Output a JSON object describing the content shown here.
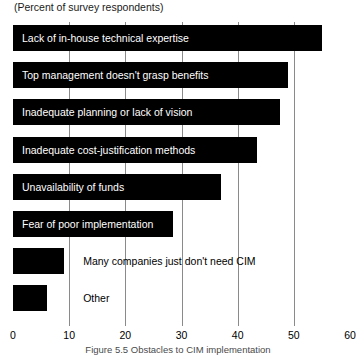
{
  "subtitle": "(Percent of survey respondents)",
  "caption": "Figure 5.5   Obstacles to CIM implementation",
  "colors": {
    "bar": "#000000",
    "grid": "#8a8a8a",
    "bar_text": "#ffffff",
    "text": "#000000",
    "background": "#ffffff"
  },
  "axis": {
    "ticks": [
      0,
      10,
      20,
      30,
      40,
      50,
      60
    ],
    "tick_labels": [
      "0",
      "10",
      "20",
      "30",
      "40",
      "50",
      "60"
    ],
    "min": 0,
    "max": 60
  },
  "chart_data": {
    "type": "bar",
    "orientation": "horizontal",
    "title": "",
    "subtitle": "(Percent of survey respondents)",
    "xlabel": "",
    "ylabel": "",
    "xlim": [
      0,
      60
    ],
    "grid": true,
    "grid_axis": "x",
    "legend": false,
    "categories": [
      "Lack of in-house technical expertise",
      "Top management doesn't grasp benefits",
      "Inadequate planning or lack of vision",
      "Inadequate cost-justification methods",
      "Unavailability of funds",
      "Fear of poor implementation",
      "Many companies just don't need CIM",
      "Other"
    ],
    "values": [
      55,
      49,
      47.5,
      43.5,
      37,
      28.5,
      9,
      6
    ],
    "xticks": [
      0,
      10,
      20,
      30,
      40,
      50,
      60
    ],
    "label_placement": [
      "inside",
      "inside",
      "inside",
      "inside",
      "inside",
      "inside",
      "outside",
      "outside"
    ]
  }
}
